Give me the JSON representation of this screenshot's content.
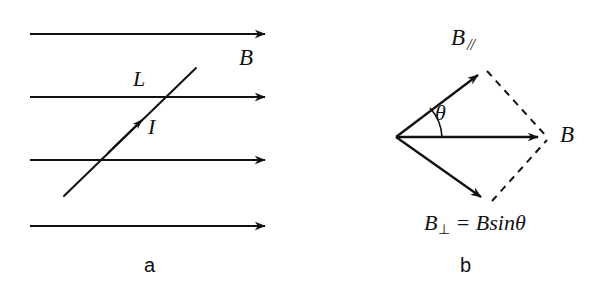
{
  "figure": {
    "caption_a": "a",
    "caption_b": "b",
    "background_color": "#ffffff",
    "stroke_color": "#111111"
  },
  "panel_a": {
    "name": "straight conductor in a uniform magnetic field",
    "field_label": "B",
    "length_label": "L",
    "current_label": "I",
    "caption": "a",
    "field_lines": [
      {
        "x1": 30,
        "y1": 34,
        "x2": 273,
        "y2": 34
      },
      {
        "x1": 30,
        "y1": 97,
        "x2": 273,
        "y2": 97
      },
      {
        "x1": 30,
        "y1": 160,
        "x2": 273,
        "y2": 160
      },
      {
        "x1": 30,
        "y1": 226,
        "x2": 273,
        "y2": 226
      }
    ],
    "conductor": {
      "x1": 64,
      "y1": 196,
      "x2": 196,
      "y2": 68
    },
    "current_arrow": {
      "x": 136,
      "y": 124
    }
  },
  "panel_b": {
    "name": "vector decomposition of B into parallel and perpendicular components",
    "parallel_label": "B",
    "parallel_subscript": "//",
    "angle_label": "θ",
    "resultant_label": "B",
    "perpendicular_equation_lhs": "B",
    "perpendicular_subscript": "⊥",
    "perpendicular_equation_rhs": "= Bsinθ",
    "caption": "b",
    "origin": {
      "x": 396,
      "y": 137
    },
    "top_vertex": {
      "x": 484,
      "y": 70
    },
    "bottom_vertex": {
      "x": 487,
      "y": 202
    },
    "right_vertex": {
      "x": 546,
      "y": 137
    },
    "angle_arc_radius": 46
  }
}
